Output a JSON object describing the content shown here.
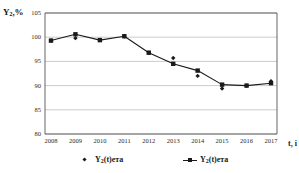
{
  "chart_data": {
    "type": "line",
    "title": "",
    "xlabel": "t, і",
    "ylabel": "Y2,%",
    "ylabel_main": "Y",
    "ylabel_sub": "2",
    "ylabel_suffix": ",%",
    "categories": [
      "2008",
      "2009",
      "2010",
      "2011",
      "2012",
      "2013",
      "2014",
      "2015",
      "2016",
      "2017"
    ],
    "ylim": [
      80,
      105
    ],
    "xlim_labels": [
      "2008",
      "2017"
    ],
    "yticks": [
      80,
      85,
      90,
      95,
      100,
      105
    ],
    "ytick_labels": [
      "80",
      "85",
      "90",
      "95",
      "100",
      "105"
    ],
    "grid": true,
    "grid_axis": "y",
    "legend_position": "bottom",
    "series": [
      {
        "name": "Y2(t)ета",
        "label_main": "Y",
        "label_sub": "2",
        "label_suffix": "(t)ета",
        "marker": "square",
        "line": true,
        "color": "#1a1a1a",
        "values": [
          99.3,
          100.6,
          99.4,
          100.2,
          96.8,
          94.5,
          93.1,
          90.2,
          90.0,
          90.5
        ]
      },
      {
        "name": "Y2(t)факт",
        "label_main": "Y",
        "label_sub": "2",
        "label_suffix": "(t)ета",
        "marker": "diamond",
        "line": false,
        "color": "#1a1a1a",
        "values": [
          99.3,
          99.8,
          99.4,
          100.2,
          96.8,
          95.7,
          92.0,
          89.4,
          90.0,
          90.9
        ]
      }
    ]
  },
  "legend": {
    "entries": [
      {
        "label_main": "Y",
        "label_sub": "2",
        "label_suffix": "(t)ета",
        "marker": "diamond"
      },
      {
        "label_main": "Y",
        "label_sub": "2",
        "label_suffix": "(t)ета",
        "marker": "line-square"
      }
    ]
  },
  "colors": {
    "axis": "#555555",
    "grid": "#bfbfbf",
    "series": "#1a1a1a",
    "background": "#ffffff",
    "text": "#1a1a1a"
  }
}
